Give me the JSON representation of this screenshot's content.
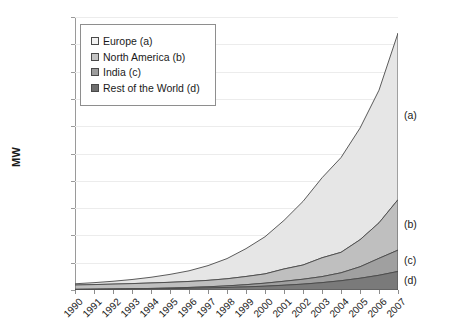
{
  "chart_data": {
    "type": "area",
    "stacked": true,
    "title": "",
    "xlabel": "",
    "ylabel": "MW",
    "ylim": [
      0,
      100000
    ],
    "ytick_step": 10000,
    "yticks": [
      "10000",
      "20000",
      "30000",
      "40000",
      "50000",
      "60000",
      "70000",
      "80000",
      "90000",
      "100000"
    ],
    "grid": true,
    "legend_position": "top-left-inside",
    "categories": [
      "1990",
      "1991",
      "1992",
      "1993",
      "1994",
      "1995",
      "1996",
      "1997",
      "1998",
      "1999",
      "2000",
      "2001",
      "2002",
      "2003",
      "2004",
      "2005",
      "2006",
      "2007"
    ],
    "series": [
      {
        "name": "Rest of the World (d)",
        "annotation": "(d)",
        "color": "#7a7a7a",
        "values": [
          200,
          240,
          290,
          350,
          430,
          520,
          640,
          780,
          950,
          1150,
          1400,
          1750,
          2150,
          2700,
          3400,
          4300,
          5400,
          6800
        ]
      },
      {
        "name": "India (c)",
        "annotation": "(c)",
        "color": "#a0a0a0",
        "values": [
          30,
          45,
          65,
          95,
          140,
          200,
          290,
          400,
          560,
          800,
          1100,
          1450,
          1800,
          2200,
          2900,
          4200,
          6200,
          7800
        ]
      },
      {
        "name": "North America (b)",
        "annotation": "(b)",
        "color": "#bfbfbf",
        "values": [
          1600,
          1700,
          1800,
          1900,
          2000,
          2100,
          2200,
          2350,
          2600,
          3000,
          3400,
          4500,
          5200,
          6900,
          7500,
          9900,
          13000,
          18500
        ]
      },
      {
        "name": "Europe (a)",
        "annotation": "(a)",
        "color": "#e6e6e6",
        "values": [
          450,
          700,
          1050,
          1500,
          2100,
          2900,
          3900,
          5400,
          7400,
          10200,
          13600,
          17800,
          23300,
          29300,
          34700,
          40900,
          48600,
          61000
        ]
      }
    ],
    "totals": [
      2280,
      2685,
      3205,
      3845,
      4670,
      5720,
      7030,
      8930,
      11510,
      15150,
      19500,
      25500,
      32450,
      41100,
      48500,
      59300,
      73200,
      94100
    ]
  },
  "legend": {
    "items": [
      {
        "label": "Europe (a)",
        "swatch": "#f2f2f2"
      },
      {
        "label": "North America (b)",
        "swatch": "#c4c4c4"
      },
      {
        "label": "India (c)",
        "swatch": "#9d9d9d"
      },
      {
        "label": "Rest of the World (d)",
        "swatch": "#6e6e6e"
      }
    ]
  },
  "colors": {
    "gridline": "#ececec",
    "axis": "#8e8e8e",
    "series_outline": "#4a4a4a"
  }
}
